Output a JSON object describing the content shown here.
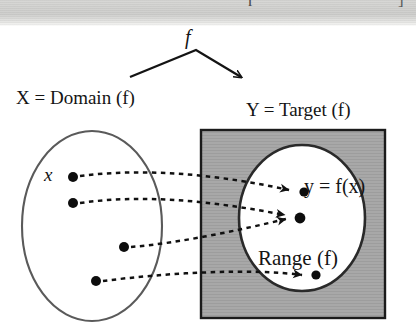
{
  "figure": {
    "kind": "function-mapping-diagram",
    "caption_labels": {
      "domain_label": "X = Domain (f)",
      "target_label": "Y = Target (f)",
      "range_label": "Range (f)",
      "image_label": "y = f(x)",
      "element_label": "x",
      "map_label": "f"
    },
    "scan_artifact": {
      "cropped_char_1": "r",
      "cropped_char_2": "]"
    },
    "colors": {
      "ink": "#141414",
      "target_box_fill": "#a8a8a8",
      "target_box_stroke": "#1b1b1b",
      "range_fill": "#ffffff",
      "range_stroke": "#2a2a2a",
      "domain_stroke": "#5a5a5a",
      "scan_band": "#d4d4d2"
    },
    "shapes": {
      "domain_ellipse": {
        "cx": 92,
        "cy": 226,
        "rx": 70,
        "ry": 95
      },
      "target_rect": {
        "x": 201,
        "y": 130,
        "width": 184,
        "height": 188
      },
      "range_ellipse": {
        "cx": 302,
        "cy": 218,
        "rx": 63,
        "ry": 73
      }
    },
    "domain_points": [
      {
        "id": "x1",
        "cx": 73,
        "cy": 177,
        "labeled": "x"
      },
      {
        "id": "x2",
        "cx": 73,
        "cy": 203,
        "labeled": ""
      },
      {
        "id": "x3",
        "cx": 124,
        "cy": 247,
        "labeled": ""
      },
      {
        "id": "x4",
        "cx": 96,
        "cy": 281,
        "labeled": ""
      }
    ],
    "range_points": [
      {
        "id": "y1",
        "cx": 304,
        "cy": 192,
        "labeled": "y = f(x)"
      },
      {
        "id": "y2",
        "cx": 300,
        "cy": 218,
        "labeled": ""
      },
      {
        "id": "y3",
        "cx": 316,
        "cy": 275,
        "labeled": ""
      }
    ],
    "mappings": [
      {
        "from": "x1",
        "to": "y1"
      },
      {
        "from": "x2",
        "to": "y2"
      },
      {
        "from": "x3",
        "to": "y2"
      },
      {
        "from": "x4",
        "to": "y3"
      }
    ],
    "map_arrow": {
      "from": [
        130,
        77
      ],
      "apex": [
        196,
        50
      ],
      "to": [
        243,
        78
      ]
    }
  }
}
